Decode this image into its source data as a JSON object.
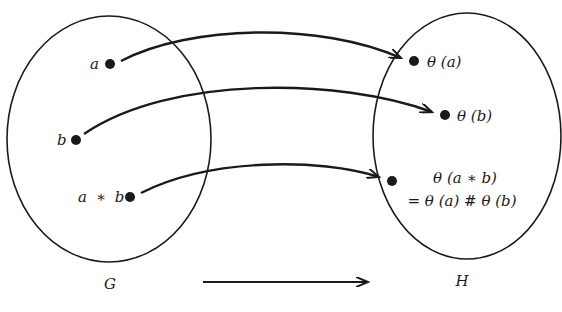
{
  "diagram": {
    "type": "homomorphism-mapping",
    "colors": {
      "ink": "#1a1a1a",
      "background": "#ffffff"
    },
    "sets": [
      {
        "id": "G",
        "label": "G"
      },
      {
        "id": "H",
        "label": "H"
      }
    ],
    "domain_points": [
      {
        "id": "a",
        "label": "a"
      },
      {
        "id": "b",
        "label": "b"
      },
      {
        "id": "ab",
        "label_left": "a",
        "operator": "∗",
        "label_right": "b"
      }
    ],
    "codomain_points": [
      {
        "id": "theta_a",
        "label": "θ (a)"
      },
      {
        "id": "theta_b",
        "label": "θ (b)"
      },
      {
        "id": "theta_ab",
        "label_line1": "θ (a ∗ b)",
        "label_line2": "= θ (a) # θ (b)"
      }
    ],
    "mappings": [
      {
        "from": "a",
        "to": "theta_a"
      },
      {
        "from": "b",
        "to": "theta_b"
      },
      {
        "from": "ab",
        "to": "theta_ab"
      }
    ],
    "bottom_arrow": {
      "from": "G",
      "to": "H"
    }
  }
}
